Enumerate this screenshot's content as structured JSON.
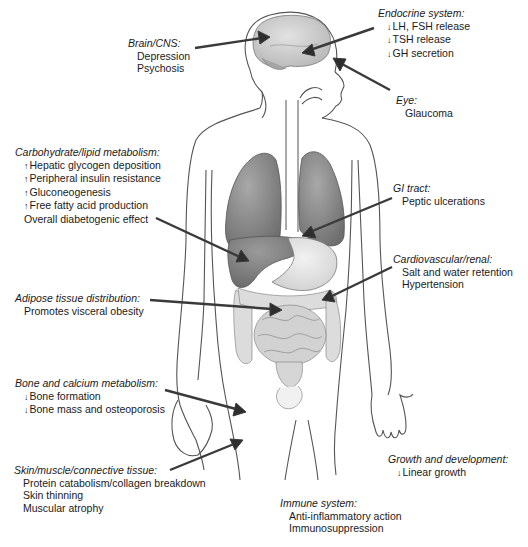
{
  "diagram": {
    "colors": {
      "outline": "#555555",
      "organ_dark": "#8a8a8a",
      "organ_light": "#d6d6d6",
      "arrow": "#3a3a3a",
      "text": "#1a1a1a"
    }
  },
  "labels": {
    "brain": {
      "title": "Brain/CNS:",
      "items": [
        {
          "text": "Depression"
        },
        {
          "text": "Psychosis"
        }
      ]
    },
    "endocrine": {
      "title": "Endocrine system:",
      "items": [
        {
          "marker": "↓",
          "text": "LH, FSH release"
        },
        {
          "marker": "↓",
          "text": "TSH release"
        },
        {
          "marker": "↓",
          "text": "GH secretion"
        }
      ]
    },
    "eye": {
      "title": "Eye:",
      "items": [
        {
          "text": "Glaucoma"
        }
      ]
    },
    "carb": {
      "title": "Carbohydrate/lipid metabolism:",
      "items": [
        {
          "marker": "↑",
          "text": "Hepatic glycogen deposition"
        },
        {
          "marker": "↑",
          "text": "Peripheral insulin resistance"
        },
        {
          "marker": "↑",
          "text": "Gluconeogenesis"
        },
        {
          "marker": "↑",
          "text": "Free fatty acid production"
        },
        {
          "text": "Overall diabetogenic effect"
        }
      ]
    },
    "gi": {
      "title": "GI tract:",
      "items": [
        {
          "text": "Peptic ulcerations"
        }
      ]
    },
    "cardio": {
      "title": "Cardiovascular/renal:",
      "items": [
        {
          "text": "Salt and water retention"
        },
        {
          "text": "Hypertension"
        }
      ]
    },
    "adipose": {
      "title": "Adipose tissue distribution:",
      "items": [
        {
          "text": "Promotes visceral obesity"
        }
      ]
    },
    "bone": {
      "title": "Bone and calcium metabolism:",
      "items": [
        {
          "marker": "↓",
          "text": "Bone formation"
        },
        {
          "marker": "↓",
          "text": "Bone mass and osteoporosis"
        }
      ]
    },
    "skin": {
      "title": "Skin/muscle/connective tissue:",
      "items": [
        {
          "text": "Protein catabolism/collagen breakdown"
        },
        {
          "text": "Skin thinning"
        },
        {
          "text": "Muscular atrophy"
        }
      ]
    },
    "growth": {
      "title": "Growth and development:",
      "items": [
        {
          "marker": "↓",
          "text": "Linear growth"
        }
      ]
    },
    "immune": {
      "title": "Immune system:",
      "items": [
        {
          "text": "Anti-inflammatory action"
        },
        {
          "text": "Immunosuppression"
        }
      ]
    }
  }
}
